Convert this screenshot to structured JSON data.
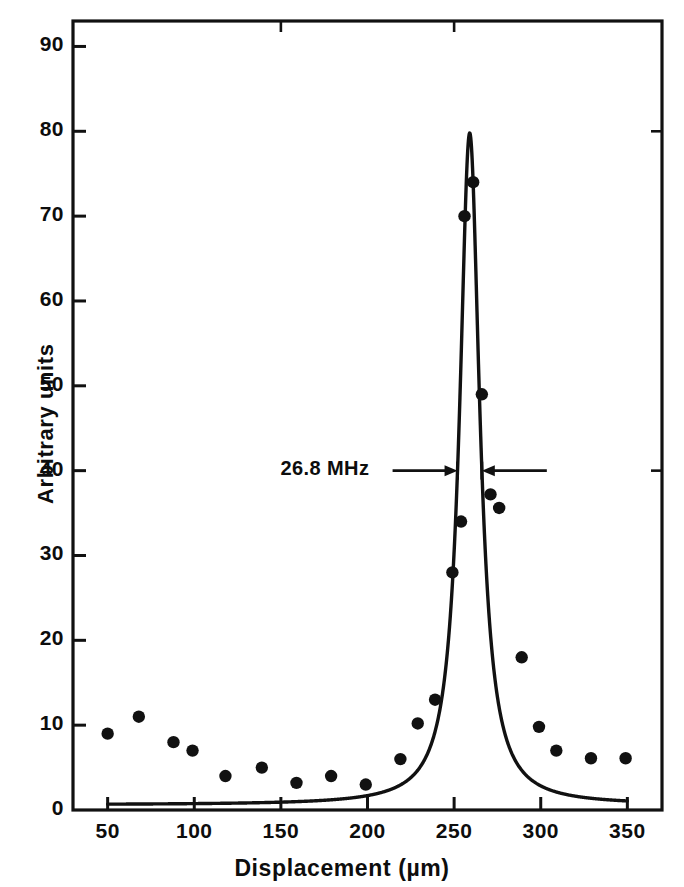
{
  "chart_data": {
    "type": "line",
    "title": "",
    "subtitle": "",
    "xlabel": "Displacement   (µm)",
    "ylabel": "Arbitrary units",
    "xlim": [
      30,
      370
    ],
    "ylim": [
      0,
      93
    ],
    "grid": false,
    "legend": "none",
    "xticks": [
      50,
      100,
      150,
      200,
      250,
      300,
      350
    ],
    "xtick_labels": [
      "50",
      "100",
      "150",
      "200",
      "250",
      "300",
      "350"
    ],
    "yticks": [
      0,
      10,
      20,
      30,
      40,
      50,
      60,
      70,
      80,
      90
    ],
    "ytick_labels": [
      "0",
      "10",
      "20",
      "30",
      "40",
      "50",
      "60",
      "70",
      "80",
      "90"
    ],
    "annotations": [
      {
        "text": "26.8 MHz",
        "x": 215,
        "y": 40,
        "kind": "linewidth-marker",
        "arrow_left_x": 252,
        "arrow_right_x": 266
      }
    ],
    "series": [
      {
        "name": "data points",
        "type": "scatter",
        "marker": "filled-circle",
        "color": "#111111",
        "points": [
          [
            50,
            9.0
          ],
          [
            68,
            11.0
          ],
          [
            88,
            8.0
          ],
          [
            99,
            7.0
          ],
          [
            118,
            4.0
          ],
          [
            139,
            5.0
          ],
          [
            159,
            3.2
          ],
          [
            179,
            4.0
          ],
          [
            199,
            3.0
          ],
          [
            219,
            6.0
          ],
          [
            229,
            10.2
          ],
          [
            239,
            13.0
          ],
          [
            249,
            28.0
          ],
          [
            254,
            34.0
          ],
          [
            256,
            70.0
          ],
          [
            261,
            74.0
          ],
          [
            266,
            49.0
          ],
          [
            271,
            37.2
          ],
          [
            276,
            35.6
          ],
          [
            289,
            18.0
          ],
          [
            299,
            9.8
          ],
          [
            309,
            7.0
          ],
          [
            329,
            6.1
          ],
          [
            349,
            6.1
          ]
        ]
      },
      {
        "name": "Lorentzian fit",
        "type": "line",
        "color": "#111111",
        "peak_center": 259,
        "peak_height": 79.8,
        "half_width": 7.0,
        "baseline": 0.6,
        "x_start": 50,
        "x_end": 350
      }
    ]
  },
  "axis": {
    "ylabel": "Arbitrary units",
    "xlabel": "Displacement   (µm)"
  },
  "annotation": {
    "linewidth_label": "26.8 MHz"
  }
}
